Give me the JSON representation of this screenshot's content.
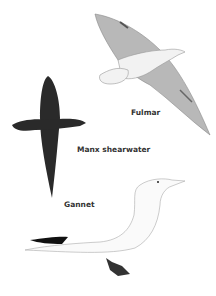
{
  "birds": [
    {
      "name": "Fulmar",
      "label_x": 131,
      "label_y": 108
    },
    {
      "name": "Manx shearwater",
      "label_x": 77,
      "label_y": 145
    },
    {
      "name": "Gannet",
      "label_x": 64,
      "label_y": 200
    }
  ],
  "colors": {
    "fulmar_wing": "#b8b8b8",
    "fulmar_body": "#f2f2f2",
    "shearwater": "#2a2a2a",
    "gannet_body": "#fafafa",
    "gannet_wingtip": "#111111",
    "outline": "#888888"
  }
}
